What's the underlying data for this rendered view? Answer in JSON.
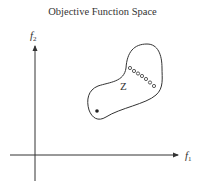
{
  "title": "Objective Function Space",
  "axes": {
    "x_label": "f",
    "x_sub": "1",
    "y_label": "f",
    "y_sub": "2"
  },
  "region_label": "Z",
  "colors": {
    "stroke": "#333333",
    "background": "#ffffff"
  },
  "points": {
    "pareto_open_circles": 7,
    "ideal_point_filled": 1
  }
}
